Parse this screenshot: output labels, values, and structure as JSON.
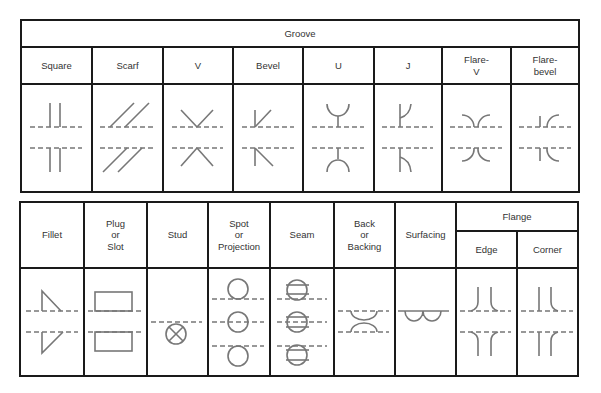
{
  "groove_table": {
    "title": "Groove",
    "columns": [
      {
        "label": "Square",
        "symbol": "square-groove"
      },
      {
        "label": "Scarf",
        "symbol": "scarf-groove"
      },
      {
        "label": "V",
        "symbol": "v-groove"
      },
      {
        "label": "Bevel",
        "symbol": "bevel-groove"
      },
      {
        "label": "U",
        "symbol": "u-groove"
      },
      {
        "label": "J",
        "symbol": "j-groove"
      },
      {
        "label": "Flare-\nV",
        "symbol": "flare-v-groove"
      },
      {
        "label": "Flare-\nbevel",
        "symbol": "flare-bevel-groove"
      }
    ]
  },
  "weld_table": {
    "columns": [
      {
        "label": "Fillet",
        "symbol": "fillet"
      },
      {
        "label": "Plug\nor\nSlot",
        "symbol": "plug-slot"
      },
      {
        "label": "Stud",
        "symbol": "stud"
      },
      {
        "label": "Spot\nor\nProjection",
        "symbol": "spot-projection"
      },
      {
        "label": "Seam",
        "symbol": "seam"
      },
      {
        "label": "Back\nor\nBacking",
        "symbol": "back-backing"
      },
      {
        "label": "Surfacing",
        "symbol": "surfacing"
      }
    ],
    "flange": {
      "title": "Flange",
      "columns": [
        {
          "label": "Edge",
          "symbol": "flange-edge"
        },
        {
          "label": "Corner",
          "symbol": "flange-corner"
        }
      ]
    }
  },
  "colors": {
    "border": "#1a1a1a",
    "symbol": "#777777",
    "text": "#333333"
  }
}
